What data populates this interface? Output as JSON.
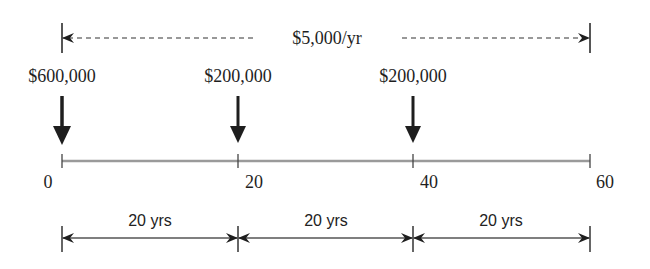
{
  "diagram": {
    "type": "cash-flow-timeline",
    "annuity": {
      "label": "$5,000/yr",
      "from_year": 0,
      "to_year": 60
    },
    "withdrawals": [
      {
        "label": "$600,000",
        "year": 0
      },
      {
        "label": "$200,000",
        "year": 20
      },
      {
        "label": "$200,000",
        "year": 40
      }
    ],
    "timeline": {
      "ticks": [
        {
          "label": "0",
          "year": 0
        },
        {
          "label": "20",
          "year": 20
        },
        {
          "label": "40",
          "year": 40
        },
        {
          "label": "60",
          "year": 60
        }
      ]
    },
    "intervals": [
      {
        "label": "20 yrs",
        "from": 0,
        "to": 20
      },
      {
        "label": "20 yrs",
        "from": 20,
        "to": 40
      },
      {
        "label": "20 yrs",
        "from": 40,
        "to": 60
      }
    ],
    "colors": {
      "ink": "#1e1e1e",
      "timeline": "#9a9a9a",
      "background": "#ffffff"
    }
  }
}
